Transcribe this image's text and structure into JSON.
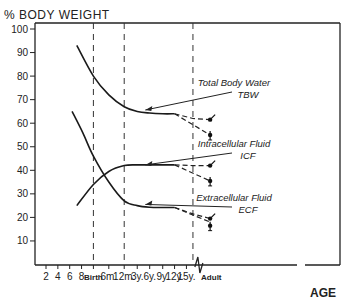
{
  "chart_data": {
    "type": "line",
    "title": "% BODY WEIGHT",
    "xlabel": "AGE",
    "ylabel": "% BODY WEIGHT",
    "ylim": [
      0,
      100
    ],
    "yticks": [
      10,
      20,
      30,
      40,
      50,
      60,
      70,
      80,
      90,
      100
    ],
    "xtick_labels": [
      "2",
      "4",
      "6",
      "8",
      "Birth",
      "6m.",
      "12m.",
      "3y.",
      "6y.",
      "9y.",
      "12y.",
      "15y.",
      "Adult"
    ],
    "x_positions": {
      "2": 0,
      "4": 1,
      "6": 2,
      "8": 3,
      "Birth": 4,
      "6m.": 5.3,
      "12m.": 6.6,
      "3y.": 7.7,
      "6y.": 8.75,
      "9y.": 9.85,
      "12y.": 10.85,
      "15y.": 11.85,
      "divider": 12.4,
      "break": 12.9,
      "Adult": 13.95
    },
    "vertical_dashed_lines_at": [
      "Birth",
      "12m.",
      "divider"
    ],
    "axis_break_at": "break",
    "grid": false,
    "series": [
      {
        "name": "Total Body Water",
        "abbr": "TBW",
        "points": [
          [
            2.6,
            93
          ],
          [
            4,
            80
          ],
          [
            5.3,
            72
          ],
          [
            6.6,
            67
          ],
          [
            7.7,
            65
          ],
          [
            8.75,
            64.3
          ],
          [
            9.85,
            64
          ],
          [
            10.85,
            64
          ]
        ],
        "dashed_projection": [
          [
            10.85,
            64
          ],
          [
            12.4,
            62
          ],
          [
            13.85,
            61.5
          ]
        ],
        "dashed_projection_2": [
          [
            10.85,
            64
          ],
          [
            13.85,
            55
          ]
        ],
        "adult_markers": [
          {
            "x": 13.85,
            "value": 61.5,
            "style": "male"
          },
          {
            "x": 13.85,
            "value": 55,
            "style": "female"
          }
        ]
      },
      {
        "name": "Intracellular Fluid",
        "abbr": "ICF",
        "points": [
          [
            2.6,
            25
          ],
          [
            4,
            34
          ],
          [
            5.3,
            39.5
          ],
          [
            6.6,
            42
          ],
          [
            7.7,
            42.3
          ],
          [
            8.75,
            42.3
          ],
          [
            9.85,
            42.3
          ],
          [
            10.85,
            42.3
          ]
        ],
        "dashed_projection": [
          [
            10.85,
            42.3
          ],
          [
            12.4,
            42
          ],
          [
            13.85,
            42
          ]
        ],
        "dashed_projection_2": [
          [
            10.85,
            42.3
          ],
          [
            13.85,
            35.5
          ]
        ],
        "adult_markers": [
          {
            "x": 13.85,
            "value": 42,
            "style": "male"
          },
          {
            "x": 13.85,
            "value": 35.5,
            "style": "female"
          }
        ]
      },
      {
        "name": "Extracellular Fluid",
        "abbr": "ECF",
        "points": [
          [
            2.2,
            65
          ],
          [
            3.1,
            56
          ],
          [
            4,
            46
          ],
          [
            5.3,
            35
          ],
          [
            6.6,
            27
          ],
          [
            7.7,
            25
          ],
          [
            8.75,
            24.3
          ],
          [
            9.85,
            24.2
          ],
          [
            10.85,
            24.2
          ]
        ],
        "dashed_projection": [
          [
            10.85,
            24.2
          ],
          [
            12.4,
            21.5
          ],
          [
            13.85,
            19.5
          ]
        ],
        "dashed_projection_2": [
          [
            10.85,
            24.2
          ],
          [
            12.4,
            21
          ],
          [
            13.85,
            18
          ]
        ],
        "adult_markers": [
          {
            "x": 13.85,
            "value": 19.5,
            "style": "male"
          },
          {
            "x": 13.85,
            "value": 16.5,
            "style": "female"
          }
        ]
      }
    ],
    "annotations": [
      {
        "line1": "Total Body Water",
        "line2": "TBW",
        "series": "Total Body Water",
        "arrow_to": [
          7.2,
          65.6
        ]
      },
      {
        "line1": "Intracellular Fluid",
        "line2": "ICF",
        "series": "Intracellular Fluid",
        "arrow_to": [
          7.2,
          42.3
        ]
      },
      {
        "line1": "Extracellular Fluid",
        "line2": "ECF",
        "series": "Extracellular Fluid",
        "arrow_to": [
          7.2,
          25.5
        ]
      }
    ]
  }
}
